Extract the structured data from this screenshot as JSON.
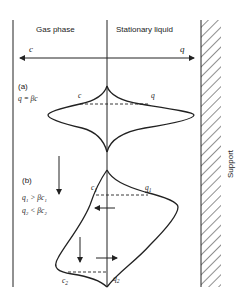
{
  "headers": {
    "gas_phase": "Gas phase",
    "stationary_liquid": "Stationary liquid"
  },
  "axis": {
    "left_label": "c",
    "right_label": "q"
  },
  "panel_a": {
    "label": "(a)",
    "condition": "q = βc",
    "peak_left_label": "c",
    "peak_right_label": "q"
  },
  "panel_b": {
    "label": "(b)",
    "condition_1": "q₁ > βc₁",
    "condition_2": "q₂ < βc₂",
    "c1_label": "c",
    "c1_sub": "1",
    "q1_label": "q",
    "q1_sub": "1",
    "c2_label": "c",
    "c2_sub": "2",
    "q2_label": "q",
    "q2_sub": "2"
  },
  "support": {
    "label": "Support"
  }
}
